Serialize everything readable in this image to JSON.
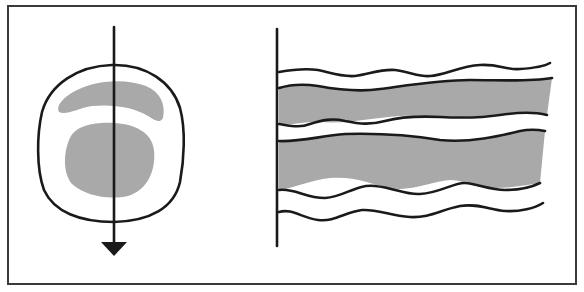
{
  "diagram": {
    "colors": {
      "stroke": "#1a1a1a",
      "shading": "#a9a9a9",
      "frame": "#3a3a3a",
      "background": "#ffffff"
    },
    "left_panel": {
      "shapes": [
        "oval-outline",
        "crescent-shaded",
        "round-blob-shaded",
        "vertical-arrow-down"
      ]
    },
    "right_panel": {
      "shapes": [
        "vertical-baseline",
        "wavy-line-1",
        "shaded-band-upper",
        "shaded-band-lower",
        "wavy-line-bottom"
      ],
      "band_count": 2
    }
  }
}
